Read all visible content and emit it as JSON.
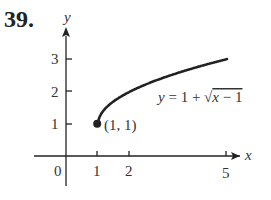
{
  "problem_number": "39.",
  "chart_data": {
    "type": "line",
    "title": "",
    "equation_label": "y = 1 + √(x − 1)",
    "xlabel": "x",
    "ylabel": "y",
    "x_ticks": [
      1,
      2,
      5
    ],
    "x_tick_labels": [
      "1",
      "2",
      "5"
    ],
    "y_ticks": [
      1,
      2,
      3
    ],
    "y_tick_labels": [
      "1",
      "2",
      "3"
    ],
    "origin_label": "0",
    "xlim": [
      -1.1,
      5.6
    ],
    "ylim": [
      -1.4,
      3.8
    ],
    "grid": false,
    "legend": null,
    "series": [
      {
        "name": "y = 1 + √(x − 1)",
        "x": [
          1,
          1.05,
          1.25,
          1.5,
          2,
          2.5,
          3,
          3.5,
          4,
          4.5,
          5
        ],
        "y": [
          1,
          1.224,
          1.5,
          1.707,
          2,
          2.225,
          2.414,
          2.581,
          2.732,
          2.871,
          3
        ]
      }
    ],
    "annotations": [
      {
        "type": "point",
        "x": 1,
        "y": 1,
        "label": "(1, 1)",
        "filled": true
      }
    ]
  }
}
